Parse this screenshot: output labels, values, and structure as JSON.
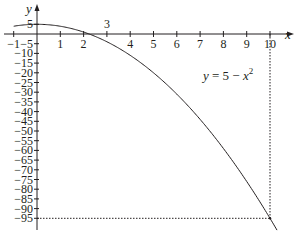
{
  "chart_data": {
    "type": "line",
    "title": "",
    "xlabel": "x",
    "ylabel": "y",
    "xlim": [
      -1,
      10.3
    ],
    "ylim": [
      -97,
      8
    ],
    "grid": false,
    "series": [
      {
        "name": "y = 5 − x²",
        "function": "5 - x^2",
        "x": [
          -1,
          0,
          1,
          2,
          2.236,
          3,
          4,
          5,
          6,
          7,
          8,
          9,
          10
        ],
        "values": [
          4,
          5,
          4,
          1,
          0,
          -4,
          -11,
          -20,
          -31,
          -44,
          -59,
          -76,
          -95
        ]
      }
    ],
    "x_ticks": [
      "−1",
      "1",
      "2",
      "3",
      "4",
      "5",
      "6",
      "7",
      "8",
      "9",
      "10"
    ],
    "y_ticks": [
      "5",
      "−5",
      "−10",
      "−15",
      "−20",
      "−25",
      "−30",
      "−35",
      "−40",
      "−45",
      "−50",
      "−55",
      "−60",
      "−65",
      "−70",
      "−75",
      "−80",
      "−85",
      "−90",
      "−95"
    ],
    "annotations": [
      {
        "text": "y = 5 − x²",
        "position": "near curve at x≈6"
      },
      {
        "text": "dotted guide lines from (10, 0) down to (10, −95) and from (0, −95) to (10, −95)"
      }
    ],
    "colors": {
      "curve": "#231f20",
      "axes": "#231f20",
      "guides": "#231f20"
    }
  },
  "labels": {
    "x_axis": "x",
    "y_axis": "y",
    "equation_y": "y",
    "equation_rest": " = 5 − ",
    "equation_x": "x",
    "equation_exp": "2",
    "x_ticks": [
      "−1",
      "1",
      "2",
      "3",
      "4",
      "5",
      "6",
      "7",
      "8",
      "9",
      "10"
    ],
    "y_ticks": [
      "5",
      "−5",
      "−10",
      "−15",
      "−20",
      "−25",
      "−30",
      "−35",
      "−40",
      "−45",
      "−50",
      "−55",
      "−60",
      "−65",
      "−70",
      "−75",
      "−80",
      "−85",
      "−90",
      "−95"
    ]
  }
}
